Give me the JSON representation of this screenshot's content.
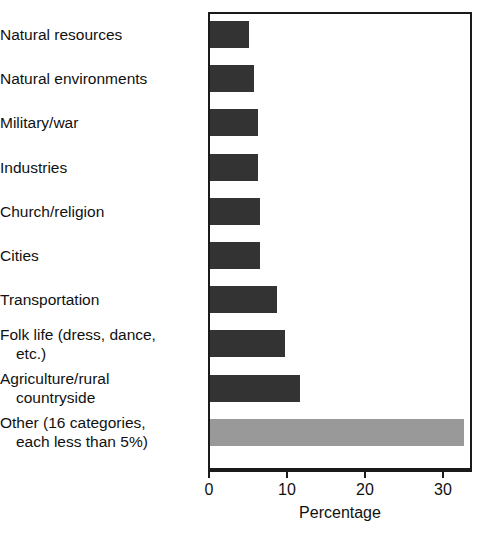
{
  "chart_data": {
    "type": "bar",
    "orientation": "horizontal",
    "title": "",
    "xlabel": "Percentage",
    "ylabel": "",
    "xlim": [
      0,
      33.8
    ],
    "xticks": [
      0,
      10,
      20,
      30
    ],
    "xtick_labels": [
      "0",
      "10",
      "20",
      "30"
    ],
    "grid": false,
    "legend": false,
    "categories": [
      "Natural resources",
      "Natural environments",
      "Military/war",
      "Industries",
      "Church/religion",
      "Cities",
      "Transportation",
      "Folk life (dress, dance, etc.)",
      "Agriculture/rural countryside",
      "Other (16 categories, each less than 5%)"
    ],
    "values": [
      5.0,
      5.7,
      6.2,
      6.2,
      6.4,
      6.4,
      8.6,
      9.6,
      11.6,
      32.5
    ],
    "bar_colors": [
      "#333333",
      "#333333",
      "#333333",
      "#333333",
      "#333333",
      "#333333",
      "#333333",
      "#333333",
      "#333333",
      "#999999"
    ]
  },
  "labels": [
    {
      "line1": "Natural resources",
      "line2": ""
    },
    {
      "line1": "Natural environments",
      "line2": ""
    },
    {
      "line1": "Military/war",
      "line2": ""
    },
    {
      "line1": "Industries",
      "line2": ""
    },
    {
      "line1": "Church/religion",
      "line2": ""
    },
    {
      "line1": "Cities",
      "line2": ""
    },
    {
      "line1": "Transportation",
      "line2": ""
    },
    {
      "line1": "Folk life (dress, dance,",
      "line2": "etc.)"
    },
    {
      "line1": "Agriculture/rural",
      "line2": "countryside"
    },
    {
      "line1": "Other (16 categories,",
      "line2": "each less than 5%)"
    }
  ],
  "axis": {
    "title": "Percentage",
    "ticks": [
      {
        "label": "0"
      },
      {
        "label": "10"
      },
      {
        "label": "20"
      },
      {
        "label": "30"
      }
    ]
  },
  "colors": {
    "bar_dark": "#333333",
    "bar_light": "#999999",
    "frame": "#1a1a1a",
    "text": "#111111",
    "background": "#ffffff"
  }
}
